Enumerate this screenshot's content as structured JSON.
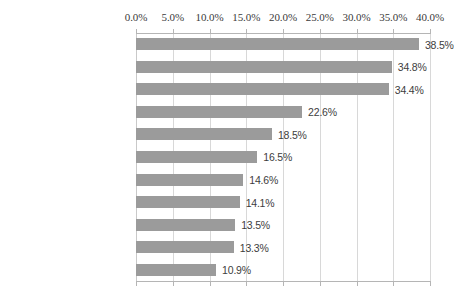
{
  "chart_data": {
    "type": "bar",
    "orientation": "horizontal",
    "title": "",
    "subtitle": "",
    "xlabel": "",
    "ylabel": "",
    "xlim": [
      0,
      40
    ],
    "grid": true,
    "legend": false,
    "axis_position": "top",
    "tick_labels": [
      "0.0%",
      "5.0%",
      "10.0%",
      "15.0%",
      "20.0%",
      "25.0%",
      "30.0%",
      "35.0%",
      "40.0%"
    ],
    "tick_values": [
      0,
      5,
      10,
      15,
      20,
      25,
      30,
      35,
      40
    ],
    "categories": [
      "Cleanliness",
      "Fast service",
      "Location",
      "Price",
      "Quality of food",
      "Open late",
      "Decor of restaurant",
      "Advertising",
      "Healthy menu options",
      "Menu selection",
      "Portion size"
    ],
    "values": [
      38.5,
      34.8,
      34.4,
      22.6,
      18.5,
      16.5,
      14.6,
      14.1,
      13.5,
      13.3,
      10.9
    ],
    "data_labels": [
      "38.5%",
      "34.8%",
      "34.4%",
      "22.6%",
      "18.5%",
      "16.5%",
      "14.6%",
      "14.1%",
      "13.5%",
      "13.3%",
      "10.9%"
    ],
    "colors": {
      "bar": "#9b9b9b",
      "gridline": "#d8d8d8",
      "axis": "#b5b5b5",
      "background": "#ffffff",
      "category_text": "#2e2e2e",
      "value_text": "#3d3d3d",
      "tick_text": "#3a3a3a"
    }
  }
}
